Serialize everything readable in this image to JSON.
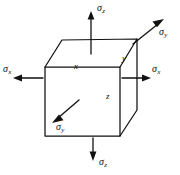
{
  "figure": {
    "background_color": "#ffffff",
    "line_color": "#111111",
    "cube": {
      "front_face": [
        [
          45,
          67
        ],
        [
          120,
          67
        ],
        [
          120,
          136
        ],
        [
          45,
          136
        ]
      ],
      "top_back_left": [
        62,
        40
      ],
      "top_back_right": [
        137,
        39
      ],
      "bottom_back_right": [
        137,
        110
      ]
    }
  },
  "stress_labels": {
    "top": {
      "symbol": "σ",
      "subscript": "z",
      "direction": "up"
    },
    "bottom": {
      "symbol": "σ",
      "subscript": "z",
      "direction": "down"
    },
    "left": {
      "symbol": "σ",
      "subscript": "x",
      "direction": "left"
    },
    "right": {
      "symbol": "σ",
      "subscript": "x",
      "direction": "right"
    },
    "upper_right": {
      "symbol": "σ",
      "subscript": "y",
      "direction": "up-right"
    },
    "lower_left": {
      "symbol": "σ",
      "subscript": "y",
      "direction": "down-left"
    }
  },
  "axis_labels": {
    "x": "x",
    "y": "y",
    "z": "z"
  }
}
